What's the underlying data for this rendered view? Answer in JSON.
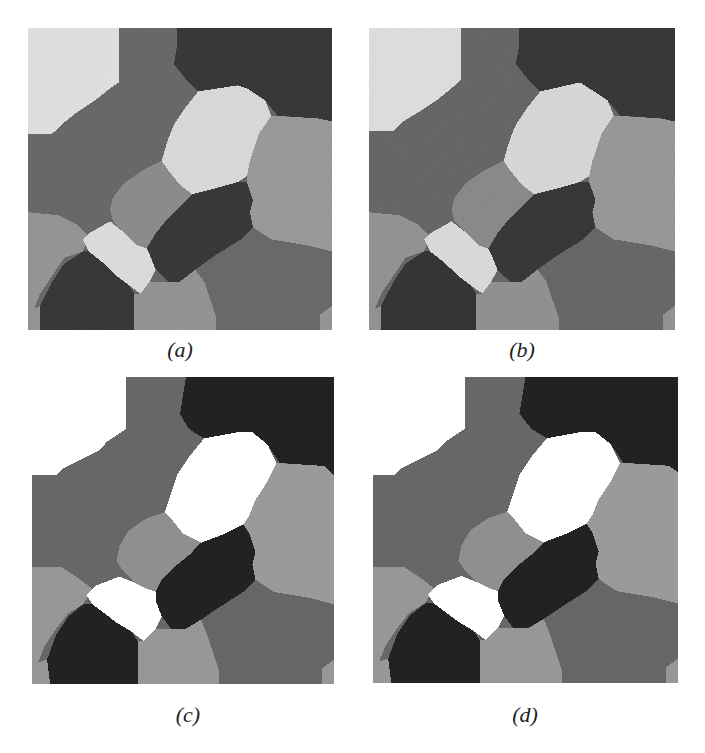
{
  "figure": {
    "panels": [
      {
        "id": "a",
        "caption": "(a)",
        "description": "noisy segmentation result",
        "noisy": true
      },
      {
        "id": "b",
        "caption": "(b)",
        "description": "noisy segmentation result",
        "noisy": true
      },
      {
        "id": "c",
        "caption": "(c)",
        "description": "clean segmentation result",
        "noisy": false
      },
      {
        "id": "d",
        "caption": "(d)",
        "description": "clean segmentation result",
        "noisy": false
      }
    ],
    "region_colors": {
      "noisy": {
        "top_left": "#e2e2e2",
        "upper_mid": "#6a6a6a",
        "top_right": "#3a3a3a",
        "center_light": "#dcdcdc",
        "right_mid": "#9c9c9c",
        "center_gray": "#8e8e8e",
        "center_dark": "#3a3a3a",
        "left_low": "#979797",
        "small_light": "#dedede",
        "bottom_left_dark": "#383838",
        "bottom_mid": "#959595",
        "bottom_right": "#6b6b6b"
      },
      "clean": {
        "top_left": "#ffffff",
        "upper_mid": "#676767",
        "top_right": "#222222",
        "center_light": "#ffffff",
        "right_mid": "#9a9a9a",
        "center_gray": "#8f8f8f",
        "center_dark": "#222222",
        "left_low": "#979797",
        "small_light": "#ffffff",
        "bottom_left_dark": "#222222",
        "bottom_mid": "#979797",
        "bottom_right": "#666666"
      }
    }
  }
}
